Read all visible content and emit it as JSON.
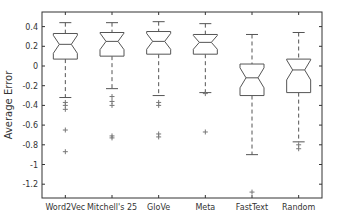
{
  "chart_data": {
    "type": "boxplot",
    "title": "",
    "xlabel": "",
    "ylabel": "Average Error",
    "ylim": [
      -1.35,
      0.54
    ],
    "yticks": [
      0.4,
      0.2,
      0,
      -0.2,
      -0.4,
      -0.6,
      -0.8,
      -1,
      -1.2
    ],
    "ytick_labels": [
      "0.4",
      "0.2",
      "0",
      "-0.2",
      "-0.4",
      "-0.6",
      "-0.8",
      "-1",
      "-1.2"
    ],
    "grid": false,
    "notched": true,
    "categories": [
      "Word2Vec",
      "Mitchell's 25",
      "GloVe",
      "Meta",
      "FastText",
      "Random"
    ],
    "series": [
      {
        "name": "Word2Vec",
        "whisker_high": 0.44,
        "q3": 0.33,
        "median": 0.22,
        "q1": 0.07,
        "whisker_low": -0.32,
        "outliers": [
          -0.37,
          -0.4,
          -0.44,
          -0.65,
          -0.87
        ]
      },
      {
        "name": "Mitchell's 25",
        "whisker_high": 0.44,
        "q3": 0.34,
        "median": 0.25,
        "q1": 0.1,
        "whisker_low": -0.23,
        "outliers": [
          -0.31,
          -0.36,
          -0.4,
          -0.71,
          -0.73
        ]
      },
      {
        "name": "GloVe",
        "whisker_high": 0.45,
        "q3": 0.35,
        "median": 0.25,
        "q1": 0.12,
        "whisker_low": -0.3,
        "outliers": [
          -0.37,
          -0.4,
          -0.69,
          -0.72
        ]
      },
      {
        "name": "Meta",
        "whisker_high": 0.43,
        "q3": 0.32,
        "median": 0.24,
        "q1": 0.12,
        "whisker_low": -0.27,
        "outliers": [
          -0.28,
          -0.67
        ]
      },
      {
        "name": "FastText",
        "whisker_high": 0.32,
        "q3": 0.02,
        "median": -0.12,
        "q1": -0.3,
        "whisker_low": -0.9,
        "outliers": [
          -1.28
        ]
      },
      {
        "name": "Random",
        "whisker_high": 0.34,
        "q3": 0.07,
        "median": -0.04,
        "q1": -0.27,
        "whisker_low": -0.77,
        "outliers": [
          -0.8,
          -0.84
        ]
      }
    ],
    "colors": {
      "box": "#555555",
      "outlier": "#777777",
      "axis": "#333333"
    }
  }
}
